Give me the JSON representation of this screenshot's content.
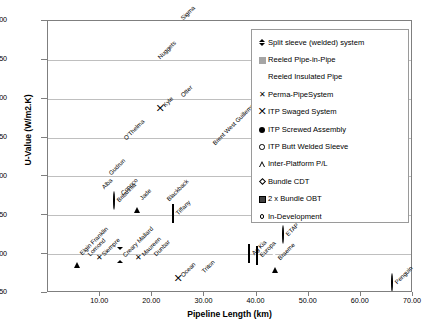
{
  "chart_data": {
    "type": "scatter",
    "title": "",
    "xlabel": "Pipeline Length (km)",
    "ylabel": "U-Value (W/m2.K)",
    "xlim": [
      0,
      70
    ],
    "ylim": [
      0.5,
      4.0
    ],
    "xticks": [
      "10.00",
      "20.00",
      "30.00",
      "40.00",
      "50.00",
      "60.00",
      "70.00"
    ],
    "xtick_values": [
      10,
      20,
      30,
      40,
      50,
      60,
      70
    ],
    "yticks": [
      "0.50",
      "1.00",
      "1.50",
      "2.00",
      "2.50",
      "3.00",
      "3.50",
      "4.00"
    ],
    "ytick_values": [
      0.5,
      1.0,
      1.5,
      2.0,
      2.5,
      3.0,
      3.5,
      4.0
    ],
    "grid": "horizontal",
    "legend_position": "top-right",
    "series": [
      {
        "name": "Split sleeve (welded) system",
        "marker": "diamond-filled"
      },
      {
        "name": "Reeled Pipe-in-Pipe",
        "marker": "square-grey"
      },
      {
        "name": "Reeled Insulated Pipe",
        "marker": "none"
      },
      {
        "name": "Perma-PipeSystem",
        "marker": "x"
      },
      {
        "name": "ITP Swaged System",
        "marker": "swaged"
      },
      {
        "name": "ITP Screwed Assembly",
        "marker": "circle-filled"
      },
      {
        "name": "ITP Butt Welded Sleeve",
        "marker": "circle-open"
      },
      {
        "name": "Inter-Platform P/L",
        "marker": "triangle-open"
      },
      {
        "name": "Bundle CDT",
        "marker": "diamond-open"
      },
      {
        "name": "2 x Bundle OBT",
        "marker": "square-dark"
      },
      {
        "name": "In-Development",
        "marker": "circle-small-open"
      }
    ],
    "points": [
      {
        "label": "Sigma",
        "x": 25.0,
        "y": 4.02,
        "marker": "none"
      },
      {
        "label": "Nuggets",
        "x": 20.5,
        "y": 3.53,
        "marker": "none"
      },
      {
        "label": "Otter",
        "x": 25.0,
        "y": 3.04,
        "marker": "none"
      },
      {
        "label": "Kyle",
        "x": 21.5,
        "y": 2.9,
        "marker": "swaged"
      },
      {
        "label": "O'Thelma",
        "x": 14.0,
        "y": 2.48,
        "marker": "none"
      },
      {
        "label": "Brent West Guillemot",
        "x": 31.0,
        "y": 2.42,
        "marker": "none"
      },
      {
        "label": "Gudrun",
        "x": 11.2,
        "y": 2.03,
        "marker": "square-grey"
      },
      {
        "label": "Alba",
        "x": 9.8,
        "y": 1.85,
        "marker": "square-grey"
      },
      {
        "label": "Conoco",
        "x": 13.4,
        "y": 1.78,
        "marker": "square-grey"
      },
      {
        "label": "Britannia",
        "x": 12.6,
        "y": 1.68,
        "marker": "circle-open"
      },
      {
        "label": "Jade",
        "x": 17.0,
        "y": 1.71,
        "marker": "triangle-open"
      },
      {
        "label": "Blackback",
        "x": 22.2,
        "y": 1.7,
        "marker": "square-grey"
      },
      {
        "label": "Tiffany",
        "x": 24.0,
        "y": 1.52,
        "marker": "square-dark"
      },
      {
        "label": "ETAP",
        "x": 45.0,
        "y": 1.24,
        "marker": "circle-small-open"
      },
      {
        "label": "Elgin Franklin",
        "x": 5.6,
        "y": 1.0,
        "marker": "triangle-open"
      },
      {
        "label": "Lomond",
        "x": 7.0,
        "y": 0.99,
        "marker": "square-grey"
      },
      {
        "label": "Siempre",
        "x": 9.8,
        "y": 0.99,
        "marker": "x"
      },
      {
        "label": "Creary Mallard",
        "x": 13.8,
        "y": 0.98,
        "marker": "diamond-filled"
      },
      {
        "label": "Maureen",
        "x": 17.4,
        "y": 0.99,
        "marker": "x"
      },
      {
        "label": "Dunbar",
        "x": 19.8,
        "y": 0.99,
        "marker": "circle-filled"
      },
      {
        "label": "Ag Kia",
        "x": 38.5,
        "y": 1.0,
        "marker": "diamond-open"
      },
      {
        "label": "Europa",
        "x": 40.0,
        "y": 0.98,
        "marker": "diamond-open"
      },
      {
        "label": "Braeme",
        "x": 43.5,
        "y": 0.94,
        "marker": "triangle-open"
      },
      {
        "label": "Ocean",
        "x": 25.0,
        "y": 0.72,
        "marker": "swaged"
      },
      {
        "label": "Triton",
        "x": 29.0,
        "y": 0.77,
        "marker": "circle-filled"
      },
      {
        "label": "Penguin",
        "x": 66.0,
        "y": 0.63,
        "marker": "circle-small-open"
      }
    ]
  },
  "legend": {
    "items": [
      {
        "label": "Split sleeve (welded) system",
        "marker": "diamond-filled"
      },
      {
        "label": "Reeled Pipe-in-Pipe",
        "marker": "square-grey"
      },
      {
        "label": "Reeled Insulated Pipe",
        "marker": "none"
      },
      {
        "label": "Perma-PipeSystem",
        "marker": "x"
      },
      {
        "label": "ITP Swaged System",
        "marker": "swaged"
      },
      {
        "label": "ITP Screwed Assembly",
        "marker": "circle-filled"
      },
      {
        "label": "ITP Butt Welded Sleeve",
        "marker": "circle-open"
      },
      {
        "label": "Inter-Platform P/L",
        "marker": "triangle-open"
      },
      {
        "label": "Bundle CDT",
        "marker": "diamond-open"
      },
      {
        "label": "2 x Bundle OBT",
        "marker": "square-dark"
      },
      {
        "label": "In-Development",
        "marker": "circle-small-open"
      }
    ]
  },
  "colors": {
    "axis": "#7f7f7f",
    "grid": "#bfbfbf",
    "marker_grey": "#a5a5a5",
    "marker_dark": "#404040",
    "text": "#000000"
  }
}
